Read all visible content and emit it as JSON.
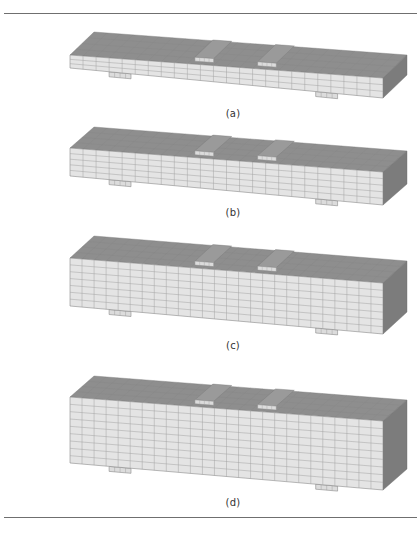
{
  "figure": {
    "colors": {
      "top_face": "#8e8e8e",
      "front_face": "#e4e4e4",
      "end_face": "#7c7c7c",
      "grid_line": "#a2a2a2",
      "plate_top": "#9a9a9a",
      "plate_front": "#dcdcdc",
      "rule": "#6f6f6f"
    },
    "panels": [
      {
        "id": "a",
        "caption": "(a)",
        "caption_pos": [
          233,
          108
        ],
        "front": {
          "tl": [
            70,
            55
          ],
          "tr": [
            383,
            78
          ],
          "br": [
            383,
            98
          ],
          "bl": [
            70,
            68
          ]
        },
        "depth_offset": [
          24,
          -23
        ],
        "cols": 24,
        "rows": 3,
        "loading_plates": [
          0.42,
          0.62
        ],
        "supports": [
          0.16,
          0.82
        ]
      },
      {
        "id": "b",
        "caption": "(b)",
        "caption_pos": [
          233,
          207
        ],
        "front": {
          "tl": [
            70,
            148
          ],
          "tr": [
            383,
            172
          ],
          "br": [
            383,
            205
          ],
          "bl": [
            70,
            176
          ]
        },
        "depth_offset": [
          24,
          -21
        ],
        "cols": 24,
        "rows": 5,
        "loading_plates": [
          0.42,
          0.62
        ],
        "supports": [
          0.16,
          0.82
        ]
      },
      {
        "id": "c",
        "caption": "(c)",
        "caption_pos": [
          233,
          340
        ],
        "front": {
          "tl": [
            70,
            258
          ],
          "tr": [
            383,
            283
          ],
          "br": [
            383,
            334
          ],
          "bl": [
            70,
            306
          ]
        },
        "depth_offset": [
          24,
          -22
        ],
        "cols": 26,
        "rows": 7,
        "loading_plates": [
          0.42,
          0.62
        ],
        "supports": [
          0.16,
          0.82
        ]
      },
      {
        "id": "d",
        "caption": "(d)",
        "caption_pos": [
          233,
          497
        ],
        "front": {
          "tl": [
            70,
            397
          ],
          "tr": [
            383,
            421
          ],
          "br": [
            383,
            490
          ],
          "bl": [
            70,
            463
          ]
        },
        "depth_offset": [
          24,
          -21
        ],
        "cols": 26,
        "rows": 9,
        "loading_plates": [
          0.42,
          0.62
        ],
        "supports": [
          0.16,
          0.82
        ]
      }
    ]
  }
}
